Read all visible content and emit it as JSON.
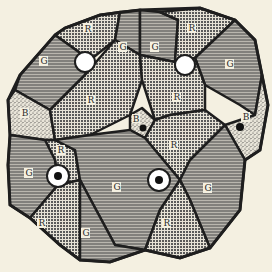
{
  "diagram": {
    "background": "#f4f0e1",
    "outline_color": "#1e1e1e",
    "legend_codes": {
      "G": "horizontal-line hatch",
      "R": "cross-hatch / dot grid",
      "B": "stipple"
    },
    "regions": [
      {
        "id": "r-top-left",
        "label": "R"
      },
      {
        "id": "g-top-mid",
        "label": "G"
      },
      {
        "id": "g-top-right-a",
        "label": "G"
      },
      {
        "id": "r-top-right",
        "label": "R"
      },
      {
        "id": "g-left-upper",
        "label": "G"
      },
      {
        "id": "g-right-upper",
        "label": "G"
      },
      {
        "id": "b-left",
        "label": "B"
      },
      {
        "id": "r-center-left",
        "label": "R"
      },
      {
        "id": "r-center-right",
        "label": "R"
      },
      {
        "id": "b-center",
        "label": "B"
      },
      {
        "id": "b-right",
        "label": "B"
      },
      {
        "id": "r-mid-right",
        "label": "R"
      },
      {
        "id": "r-left-small",
        "label": "R"
      },
      {
        "id": "g-left-lower",
        "label": "G"
      },
      {
        "id": "g-center-lower",
        "label": "G"
      },
      {
        "id": "g-right-lower",
        "label": "G"
      },
      {
        "id": "r-bottom-left",
        "label": "R"
      },
      {
        "id": "g-bottom-mid",
        "label": "G"
      },
      {
        "id": "r-bottom-right",
        "label": "R"
      }
    ],
    "nodes": [
      {
        "id": "node-top-left",
        "type": "open-circle"
      },
      {
        "id": "node-top-right",
        "type": "open-circle"
      },
      {
        "id": "node-center",
        "type": "filled-dot"
      },
      {
        "id": "node-right",
        "type": "filled-dot"
      },
      {
        "id": "node-bottom-left",
        "type": "ringed-dot"
      },
      {
        "id": "node-bottom-mid",
        "type": "ringed-dot"
      }
    ]
  }
}
